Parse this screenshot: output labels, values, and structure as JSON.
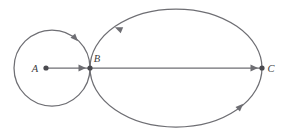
{
  "figure": {
    "background_color": "#ffffff",
    "stroke_color": "#6e6e73",
    "dot_color": "#4a4a4f",
    "label_color": "#3c3c40",
    "points": [
      {
        "id": "A",
        "label": "A",
        "x": 46,
        "y": 68,
        "label_x": 35,
        "label_y": 71.5
      },
      {
        "id": "B",
        "label": "B",
        "x": 90,
        "y": 68,
        "label_x": 96,
        "label_y": 62
      },
      {
        "id": "C",
        "label": "C",
        "x": 262,
        "y": 68,
        "label_x": 269,
        "label_y": 71.5
      }
    ],
    "shapes": {
      "small_circle": {
        "name": "small-circle",
        "cx": 52,
        "cy": 68,
        "r": 38
      },
      "large_ellipse": {
        "name": "large-ellipse",
        "cx": 176,
        "cy": 68,
        "rx": 86,
        "ry": 59
      }
    },
    "segments": [
      {
        "name": "segment-a-to-b",
        "from": "A",
        "to": "B",
        "x1": 46,
        "y1": 68,
        "x2": 90,
        "y2": 68
      },
      {
        "name": "segment-b-to-c",
        "from": "B",
        "to": "C",
        "x1": 90,
        "y1": 68,
        "x2": 262,
        "y2": 68
      }
    ],
    "direction_markers": [
      {
        "name": "circle-direction-arrow",
        "on": "small-circle",
        "x": 75,
        "y": 38,
        "angle": 42
      },
      {
        "name": "ellipse-top-direction-arrow",
        "on": "large-ellipse",
        "x": 119,
        "y": 29,
        "angle": 221
      },
      {
        "name": "ellipse-bottom-direction-arrow",
        "on": "large-ellipse",
        "x": 240,
        "y": 107,
        "angle": 312
      }
    ],
    "line_arrowheads": [
      {
        "name": "arrowhead-toward-b",
        "x": 86,
        "y": 68,
        "angle": 0
      },
      {
        "name": "arrowhead-toward-c",
        "x": 258,
        "y": 68,
        "angle": 0
      }
    ]
  }
}
